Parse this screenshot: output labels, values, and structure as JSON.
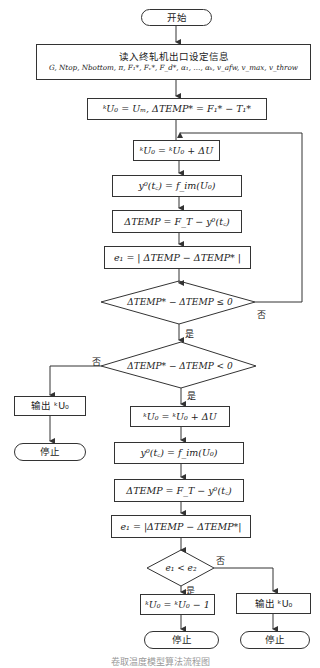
{
  "flowchart": {
    "start": "开始",
    "read_input": {
      "title": "读入终轧机出口设定信息",
      "params": "G, Ntop, Nbottom, π, F₁*, Fᵥ*, F_d*, α₁, …, αₖ, v_afw, v_max, v_throw"
    },
    "init": "ᵏU₀ = Uₘ, ΔTEMP* = F₁* − T₁*",
    "loop1": {
      "update": "ᵏU₀ = ᵏU₀ + ΔU",
      "predict": "y⁰(t꜀) = f_im(U₀)",
      "delta": "ΔTEMP = F_T − y⁰(t꜀)",
      "error": "e₁ = | ΔTEMP − ΔTEMP* |",
      "decision": "ΔTEMP* − ΔTEMP ≤ 0",
      "decision_no": "否",
      "decision_yes": "是"
    },
    "decision2": {
      "text": "ΔTEMP* − ΔTEMP < 0",
      "no": "否",
      "yes": "是"
    },
    "left_branch": {
      "output": "输出 ᵏU₀",
      "stop": "停止"
    },
    "loop2": {
      "update": "ᵏU₀ = ᵏU₀ + ΔU",
      "predict": "y⁰(t꜀) = f_im(U₀)",
      "delta": "ΔTEMP = F_T − y⁰(t꜀)",
      "error": "e₁ = |ΔTEMP − ΔTEMP*|"
    },
    "decision3": {
      "text": "e₁ < e₂",
      "no": "否",
      "yes": "是"
    },
    "yes_branch": {
      "update": "ᵏU₀ = ᵏU₀ − 1",
      "stop": "停止"
    },
    "no_branch": {
      "output": "输出 ᵏU₀",
      "stop": "停止"
    }
  },
  "caption": "卷取温度模型算法流程图"
}
